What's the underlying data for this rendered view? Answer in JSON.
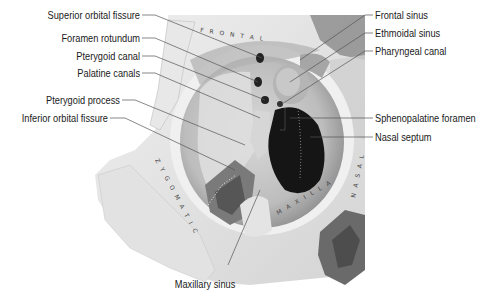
{
  "figure": {
    "bone_region_labels": [
      "FRONTAL",
      "ZYGOMATIC",
      "MAXILLA",
      "NASAL"
    ],
    "colors": {
      "background": "#ffffff",
      "bone_light": "#e6e6e6",
      "bone_mid": "#c8c8c8",
      "bone_shadow": "#9a9a9a",
      "cavity_dark": "#1a1a1a",
      "leader_line": "#555555",
      "label_text": "#1a1a1a"
    }
  },
  "labels": {
    "left": [
      {
        "text": "Superior orbital fissure"
      },
      {
        "text": "Foramen rotundum"
      },
      {
        "text": "Pterygoid canal"
      },
      {
        "text": "Palatine canals"
      },
      {
        "text": "Pterygoid process"
      },
      {
        "text": "Inferior orbital fissure"
      }
    ],
    "right": [
      {
        "text": "Frontal sinus"
      },
      {
        "text": "Ethmoidal sinus"
      },
      {
        "text": "Pharyngeal canal"
      },
      {
        "text": "Sphenopalatine foramen"
      },
      {
        "text": "Nasal septum"
      }
    ],
    "bottom": [
      {
        "text": "Maxillary sinus"
      }
    ]
  }
}
